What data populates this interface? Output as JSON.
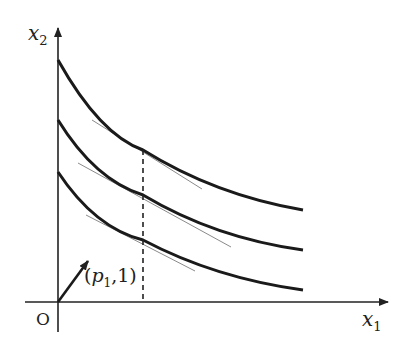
{
  "diagram": {
    "type": "indifference-curves",
    "axes": {
      "x_label": {
        "base": "x",
        "sub": "1"
      },
      "y_label": {
        "base": "x",
        "sub": "2"
      },
      "origin_label": "O"
    },
    "vector": {
      "label_open": "(",
      "label_base": "p",
      "label_sub": "1",
      "label_rest": ",1)"
    },
    "curves": [
      {
        "name": "upper",
        "start": [
          58,
          60
        ],
        "end": [
          303,
          210
        ],
        "tangent_point": [
          143,
          150
        ]
      },
      {
        "name": "middle",
        "start": [
          58,
          120
        ],
        "end": [
          303,
          250
        ],
        "tangent_point": [
          143,
          195
        ]
      },
      {
        "name": "lower",
        "start": [
          58,
          172
        ],
        "end": [
          303,
          290
        ],
        "tangent_point": [
          143,
          240
        ]
      }
    ],
    "dashed_line_x": 143,
    "colors": {
      "curve": "#1a1a1a",
      "tangent": "#8a8a8a",
      "axis": "#222222"
    }
  }
}
